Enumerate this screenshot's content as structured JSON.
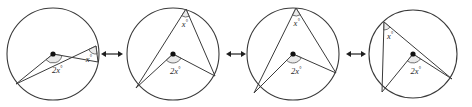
{
  "figure": {
    "style": {
      "stroke": "#3a3a3a",
      "fill": "#ffffff",
      "label_color": "#2b2b2b",
      "arc_fill": "#d8d8d8",
      "center_dot_color": "#111111"
    },
    "panels": [
      {
        "id": "panel-1",
        "index": 1,
        "cx": 53,
        "cy": 54,
        "r": 46,
        "center_label": "2x",
        "center_degree": "°",
        "inscribed_label": "x",
        "inscribed_degree": "°",
        "vertex_on_circle": {
          "x": 96,
          "y": 46
        },
        "endpoint_a": {
          "x": 16,
          "y": 84
        },
        "endpoint_b": {
          "x": 98,
          "y": 62
        },
        "center_angle_value": "2x°",
        "inscribed_angle_value": "x°"
      },
      {
        "id": "panel-2",
        "index": 2,
        "cx": 173,
        "cy": 54,
        "r": 46,
        "center_label": "2x",
        "center_degree": "°",
        "inscribed_label": "x",
        "inscribed_degree": "°",
        "vertex_on_circle": {
          "x": 186,
          "y": 9
        },
        "endpoint_a": {
          "x": 136,
          "y": 88
        },
        "endpoint_b": {
          "x": 215,
          "y": 76
        },
        "center_angle_value": "2x°",
        "inscribed_angle_value": "x°"
      },
      {
        "id": "panel-3",
        "index": 3,
        "cx": 293,
        "cy": 54,
        "r": 46,
        "center_label": "2x",
        "center_degree": "°",
        "inscribed_label": "x",
        "inscribed_degree": "°",
        "vertex_on_circle": {
          "x": 296,
          "y": 8
        },
        "endpoint_a": {
          "x": 254,
          "y": 93
        },
        "endpoint_b": {
          "x": 336,
          "y": 73
        },
        "center_angle_value": "2x°",
        "inscribed_angle_value": "x°"
      },
      {
        "id": "panel-4",
        "index": 4,
        "cx": 413,
        "cy": 54,
        "r": 44,
        "center_label": "2x",
        "center_degree": "°",
        "inscribed_label": "x",
        "inscribed_degree": "°",
        "vertex_on_circle": {
          "x": 384,
          "y": 22
        },
        "endpoint_a": {
          "x": 382,
          "y": 92
        },
        "endpoint_b": {
          "x": 452,
          "y": 79
        },
        "center_angle_value": "2x°",
        "inscribed_angle_value": "x°"
      }
    ],
    "arrows": [
      {
        "id": "arrow-1",
        "x1": 101,
        "x2": 123,
        "y": 54,
        "direction": "both"
      },
      {
        "id": "arrow-2",
        "x1": 226,
        "x2": 246,
        "y": 54,
        "direction": "both"
      },
      {
        "id": "arrow-3",
        "x1": 346,
        "x2": 366,
        "y": 54,
        "direction": "both"
      }
    ]
  }
}
